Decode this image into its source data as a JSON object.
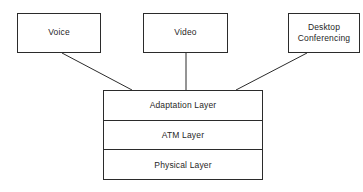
{
  "diagram": {
    "background_color": "#ffffff",
    "line_color": "#2b2b2b",
    "text_color": "#1f1f1f",
    "sources": [
      {
        "id": "voice",
        "label": "Voice"
      },
      {
        "id": "video",
        "label": "Video"
      },
      {
        "id": "desktop",
        "label": "Desktop\nConferencing"
      }
    ],
    "stack": {
      "layers": [
        {
          "id": "adaptation",
          "label": "Adaptation Layer"
        },
        {
          "id": "atm",
          "label": "ATM Layer"
        },
        {
          "id": "physical",
          "label": "Physical Layer"
        }
      ]
    },
    "connectors": [
      {
        "from": "voice",
        "to": "stack",
        "type": "diagonal"
      },
      {
        "from": "video",
        "to": "stack",
        "type": "vertical"
      },
      {
        "from": "desktop",
        "to": "stack",
        "type": "diagonal"
      }
    ]
  }
}
